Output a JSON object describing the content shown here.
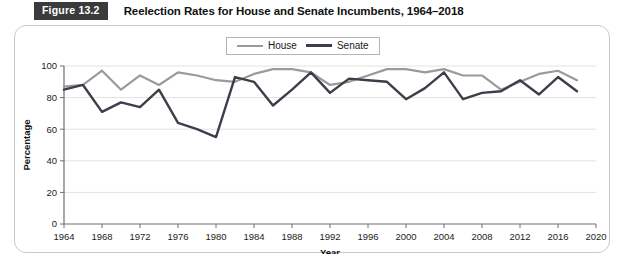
{
  "figure": {
    "number_label": "Figure 13.2",
    "title": "Reelection Rates for House and Senate Incumbents, 1964–2018"
  },
  "legend": {
    "house_label": "House",
    "senate_label": "Senate"
  },
  "colors": {
    "house_line": "#9a9a9a",
    "senate_line": "#3c3f4a",
    "grid": "#e2e2e2",
    "axis": "#6f6f6f",
    "figure_number_bg": "#3b3b3b",
    "card_border": "#c8c8c8"
  },
  "chart_data": {
    "type": "line",
    "title": "Reelection Rates for House and Senate Incumbents, 1964–2018",
    "xlabel": "Year",
    "ylabel": "Percentage",
    "xlim": [
      1964,
      2020
    ],
    "ylim": [
      0,
      100
    ],
    "xticks": [
      1964,
      1968,
      1972,
      1976,
      1980,
      1984,
      1988,
      1992,
      1996,
      2000,
      2004,
      2008,
      2012,
      2016,
      2020
    ],
    "yticks": [
      0,
      20,
      40,
      60,
      80,
      100
    ],
    "grid": true,
    "legend_position": "top-center",
    "x": [
      1964,
      1966,
      1968,
      1970,
      1972,
      1974,
      1976,
      1978,
      1980,
      1982,
      1984,
      1986,
      1988,
      1990,
      1992,
      1994,
      1996,
      1998,
      2000,
      2002,
      2004,
      2006,
      2008,
      2010,
      2012,
      2014,
      2016,
      2018
    ],
    "series": [
      {
        "name": "House",
        "values": [
          87,
          88,
          97,
          85,
          94,
          88,
          96,
          94,
          91,
          90,
          95,
          98,
          98,
          96,
          88,
          90,
          94,
          98,
          98,
          96,
          98,
          94,
          94,
          85,
          90,
          95,
          97,
          91
        ]
      },
      {
        "name": "Senate",
        "values": [
          85,
          88,
          71,
          77,
          74,
          85,
          64,
          60,
          55,
          93,
          90,
          75,
          85,
          96,
          83,
          92,
          91,
          90,
          79,
          86,
          96,
          79,
          83,
          84,
          91,
          82,
          93,
          84
        ]
      }
    ]
  }
}
